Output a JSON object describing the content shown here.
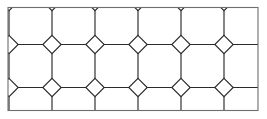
{
  "figure": {
    "width": 267,
    "height": 119
  },
  "style": {
    "background_color": "#ffffff",
    "line_color": "#2b2b2b",
    "border_color": "#6e6e6e",
    "line_width": 1.15,
    "border_width": 1.1
  },
  "border": {
    "x": 8.0,
    "y": 7.5,
    "width": 250.0,
    "height": 103.0
  },
  "pattern": {
    "type": "truncated-square-tiling",
    "period": 43.0,
    "diamond_half_diagonal": 9.2,
    "origin_x": 9.0,
    "origin_y": 1.5,
    "columns": 7,
    "rows": 4,
    "shapes": [
      "octagon",
      "square"
    ],
    "vertex_configuration": "4.8.8",
    "full_diamonds_visible": 15,
    "octagon_rows": 3,
    "octagon_columns": 6
  },
  "chart_data": {
    "type": "diagram",
    "grid": true,
    "legend": null,
    "tiling": {
      "name": "truncated square tiling",
      "schlafli": "t{4,4}",
      "vertex_config": "4.8.8",
      "period_px": 43.0,
      "diamond_half_diagonal_px": 9.2,
      "column_centers_x": [
        9,
        52,
        95,
        138,
        181,
        224,
        267
      ],
      "row_centers_y": [
        1.5,
        44.5,
        87.5,
        130.5
      ],
      "diamond_centers": [
        [
          52,
          1.5
        ],
        [
          95,
          1.5
        ],
        [
          138,
          1.5
        ],
        [
          181,
          1.5
        ],
        [
          224,
          1.5
        ],
        [
          9,
          23
        ],
        [
          52,
          23
        ],
        [
          95,
          23
        ],
        [
          138,
          23
        ],
        [
          181,
          23
        ],
        [
          224,
          23
        ],
        [
          267,
          23
        ],
        [
          52,
          44.5
        ],
        [
          95,
          44.5
        ],
        [
          138,
          44.5
        ],
        [
          181,
          44.5
        ],
        [
          224,
          44.5
        ],
        [
          9,
          66
        ],
        [
          52,
          66
        ],
        [
          95,
          66
        ],
        [
          138,
          66
        ],
        [
          181,
          66
        ],
        [
          224,
          66
        ],
        [
          267,
          66
        ],
        [
          52,
          87.5
        ],
        [
          95,
          87.5
        ],
        [
          138,
          87.5
        ],
        [
          181,
          87.5
        ],
        [
          224,
          87.5
        ],
        [
          9,
          109
        ],
        [
          52,
          109
        ],
        [
          95,
          109
        ],
        [
          138,
          109
        ],
        [
          181,
          109
        ],
        [
          224,
          109
        ],
        [
          267,
          109
        ]
      ],
      "octagon_centers": [
        [
          30.5,
          23
        ],
        [
          73.5,
          23
        ],
        [
          116.5,
          23
        ],
        [
          159.5,
          23
        ],
        [
          202.5,
          23
        ],
        [
          245.5,
          23
        ],
        [
          30.5,
          66
        ],
        [
          73.5,
          66
        ],
        [
          116.5,
          66
        ],
        [
          159.5,
          66
        ],
        [
          202.5,
          66
        ],
        [
          245.5,
          66
        ],
        [
          30.5,
          109
        ],
        [
          73.5,
          109
        ],
        [
          116.5,
          109
        ],
        [
          159.5,
          109
        ],
        [
          202.5,
          109
        ],
        [
          245.5,
          109
        ]
      ]
    }
  }
}
